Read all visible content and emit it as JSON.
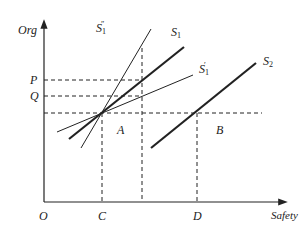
{
  "axes": {
    "y_label": "Org",
    "x_label": "Safety",
    "origin": "O"
  },
  "y_ticks": [
    "P",
    "Q"
  ],
  "x_ticks": [
    "C",
    "D"
  ],
  "regions": [
    "A",
    "B"
  ],
  "curves": [
    {
      "name": "S1''",
      "base": "S",
      "sub": "1",
      "prime": "″",
      "style": "thin"
    },
    {
      "name": "S1",
      "base": "S",
      "sub": "1",
      "prime": "",
      "style": "thick"
    },
    {
      "name": "S1'",
      "base": "S",
      "sub": "1",
      "prime": "′",
      "style": "thin"
    },
    {
      "name": "S2",
      "base": "S",
      "sub": "2",
      "prime": "",
      "style": "thick"
    }
  ],
  "colors": {
    "line": "#222222",
    "background": "#ffffff"
  }
}
